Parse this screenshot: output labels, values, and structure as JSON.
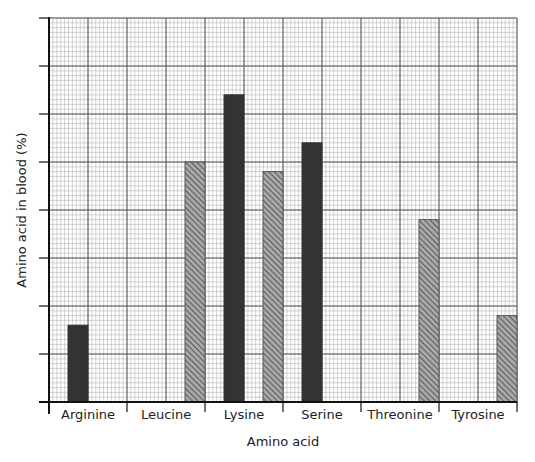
{
  "chart_data": {
    "type": "bar",
    "title": "",
    "xlabel": "Amino acid",
    "ylabel": "Amino acid in blood (%)",
    "categories": [
      "Arginine",
      "Leucine",
      "Lysine",
      "Serine",
      "Threonine",
      "Tyrosine"
    ],
    "y_tick_labels_shown": false,
    "y_units": "major gridline units (unlabeled axis)",
    "ylim": [
      0,
      8
    ],
    "grid": true,
    "legend": null,
    "series": [
      {
        "name": "solid dark bars",
        "pattern": "solid",
        "color": "#333333",
        "values": [
          1.6,
          null,
          6.4,
          5.4,
          null,
          null
        ]
      },
      {
        "name": "hatched bars",
        "pattern": "diagonal-hatch",
        "color": "#8a8a8a",
        "values": [
          null,
          5.0,
          4.8,
          null,
          3.8,
          1.8
        ]
      }
    ]
  },
  "colors": {
    "solid_bar": "#333333",
    "hatch_fill": "#8a8a8a",
    "hatch_stroke": "#555555",
    "major_grid": "#555555",
    "minor_grid": "#b5b5b5",
    "axis": "#111111"
  }
}
